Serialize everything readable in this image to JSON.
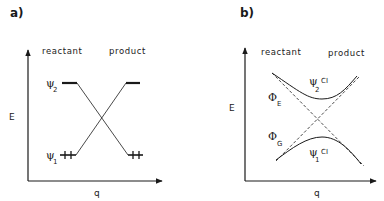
{
  "figure": {
    "panels": [
      {
        "id": "a",
        "label": "a)",
        "y_axis_label": "E",
        "x_axis_label": "q",
        "region_labels": {
          "left": "reactant",
          "right": "product"
        },
        "states": [
          {
            "symbol": "ψ",
            "subscript": "2",
            "level": "upper",
            "side": "reactant"
          },
          {
            "symbol": "ψ",
            "subscript": "1",
            "level": "lower",
            "side": "reactant",
            "occupancy": "++"
          },
          {
            "level": "upper",
            "side": "product"
          },
          {
            "level": "lower",
            "side": "product",
            "occupancy": "++"
          }
        ],
        "description": "Crossing correlation lines between reactant and product levels"
      },
      {
        "id": "b",
        "label": "b)",
        "y_axis_label": "E",
        "x_axis_label": "q",
        "region_labels": {
          "left": "reactant",
          "right": "product"
        },
        "curves": [
          {
            "symbol": "ψ",
            "subscript": "2",
            "superscript": "CI",
            "style": "solid",
            "shape": "upper avoided-crossing branch"
          },
          {
            "symbol": "ψ",
            "subscript": "1",
            "superscript": "CI",
            "style": "solid",
            "shape": "lower avoided-crossing branch"
          },
          {
            "symbol": "Φ",
            "subscript": "E",
            "style": "dashed",
            "shape": "diabatic line (descending)"
          },
          {
            "symbol": "Φ",
            "subscript": "G",
            "style": "dashed",
            "shape": "diabatic line (ascending)"
          }
        ],
        "description": "Avoided crossing with configuration interaction"
      }
    ]
  }
}
